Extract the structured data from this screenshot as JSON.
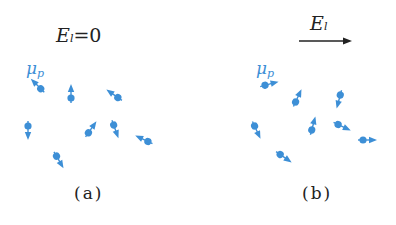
{
  "figure": {
    "colors": {
      "dipole": "#3d8fd6",
      "text": "#222222",
      "field_arrow": "#222222"
    },
    "panel_a": {
      "field_label": {
        "symbol": "E",
        "subscript": "l",
        "equals": "=0"
      },
      "dipole_label": {
        "symbol": "μ",
        "subscript": "p"
      },
      "caption": "(a)",
      "dipoles": [
        {
          "x": 40,
          "y": 88,
          "angle": 225
        },
        {
          "x": 71,
          "y": 97,
          "angle": 270
        },
        {
          "x": 117,
          "y": 97,
          "angle": 215
        },
        {
          "x": 28,
          "y": 127,
          "angle": 90
        },
        {
          "x": 89,
          "y": 132,
          "angle": 305
        },
        {
          "x": 114,
          "y": 126,
          "angle": 70
        },
        {
          "x": 147,
          "y": 141,
          "angle": 205
        },
        {
          "x": 57,
          "y": 157,
          "angle": 60
        }
      ]
    },
    "panel_b": {
      "field_label": {
        "symbol": "E",
        "subscript": "l"
      },
      "dipole_label": {
        "symbol": "μ",
        "subscript": "p"
      },
      "caption": "(b)",
      "dipoles": [
        {
          "x": 266,
          "y": 85,
          "angle": -15
        },
        {
          "x": 296,
          "y": 101,
          "angle": -65
        },
        {
          "x": 340,
          "y": 96,
          "angle": 105
        },
        {
          "x": 255,
          "y": 127,
          "angle": 65
        },
        {
          "x": 312,
          "y": 129,
          "angle": -75
        },
        {
          "x": 339,
          "y": 125,
          "angle": 25
        },
        {
          "x": 364,
          "y": 140,
          "angle": 0
        },
        {
          "x": 281,
          "y": 155,
          "angle": 35
        }
      ]
    }
  }
}
